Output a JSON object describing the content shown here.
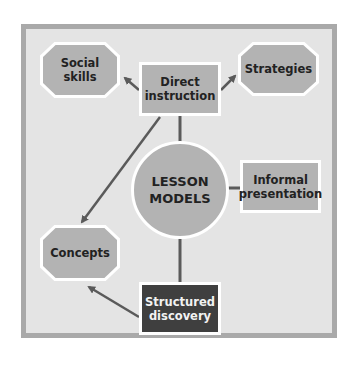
{
  "diagram": {
    "center": {
      "label_line1": "LESSON",
      "label_line2": "MODELS"
    },
    "nodes": {
      "social_skills": {
        "line1": "Social",
        "line2": "skills",
        "shape": "octagon"
      },
      "direct_instruction": {
        "line1": "Direct",
        "line2": "instruction",
        "shape": "rectangle"
      },
      "strategies": {
        "line1": "Strategies",
        "shape": "octagon"
      },
      "informal_presentation": {
        "line1": "Informal",
        "line2": "presentation",
        "shape": "rectangle"
      },
      "concepts": {
        "line1": "Concepts",
        "shape": "octagon"
      },
      "structured_discovery": {
        "line1": "Structured",
        "line2": "discovery",
        "shape": "rectangle-dark"
      }
    },
    "edges": [
      {
        "from": "direct_instruction",
        "to": "social_skills",
        "type": "arrow"
      },
      {
        "from": "direct_instruction",
        "to": "strategies",
        "type": "arrow"
      },
      {
        "from": "direct_instruction",
        "to": "concepts",
        "type": "arrow"
      },
      {
        "from": "lesson_models",
        "to": "direct_instruction",
        "type": "line"
      },
      {
        "from": "lesson_models",
        "to": "informal_presentation",
        "type": "line"
      },
      {
        "from": "lesson_models",
        "to": "structured_discovery",
        "type": "line"
      },
      {
        "from": "structured_discovery",
        "to": "concepts",
        "type": "arrow"
      }
    ],
    "colors": {
      "background": "#e4e4e4",
      "frame": "#a9a9a9",
      "node": "#b3b3b3",
      "dark_node": "#3f3f3f",
      "line": "#5a5a5a"
    }
  }
}
